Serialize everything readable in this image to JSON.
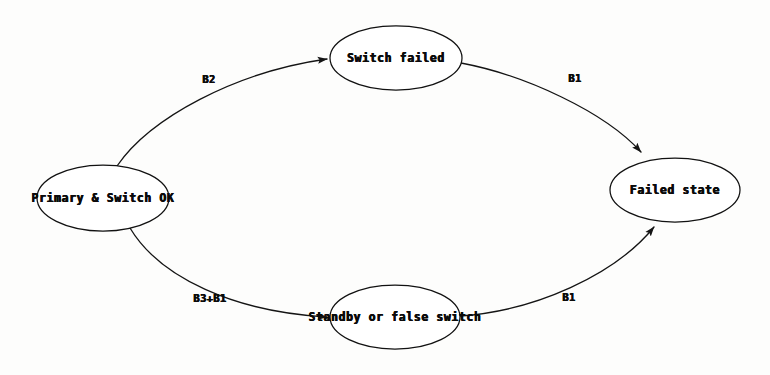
{
  "diagram": {
    "type": "state-transition-diagram",
    "background_color": "#fdfdfc",
    "stroke_color": "#141414",
    "text_color": "#0b0b0b",
    "nodes": [
      {
        "id": "primary-switch-ok",
        "label": "Primary & Switch OK",
        "cx": 103,
        "cy": 198,
        "rx": 66,
        "ry": 33
      },
      {
        "id": "switch-failed",
        "label": "Switch failed",
        "cx": 396,
        "cy": 58,
        "rx": 66,
        "ry": 32
      },
      {
        "id": "standby-or-false-switch",
        "label": "Standby or false switch",
        "cx": 395,
        "cy": 317,
        "rx": 65,
        "ry": 32
      },
      {
        "id": "failed-state",
        "label": "Failed state",
        "cx": 675,
        "cy": 190,
        "rx": 65,
        "ry": 32
      }
    ],
    "edges": [
      {
        "id": "edge-ok-to-switch-failed",
        "from": "primary-switch-ok",
        "to": "switch-failed",
        "label": "B2",
        "label_x": 209,
        "label_y": 79,
        "path": "M 117,166 C 150,118 235,72 327,59"
      },
      {
        "id": "edge-switch-failed-to-failed-state",
        "from": "switch-failed",
        "to": "failed-state",
        "label": "B1",
        "label_x": 575,
        "label_y": 78,
        "path": "M 461,63 C 525,75 605,112 641,152"
      },
      {
        "id": "edge-ok-to-standby",
        "from": "primary-switch-ok",
        "to": "standby-or-false-switch",
        "label": "B3+B1",
        "label_x": 210,
        "label_y": 298,
        "path": "M 130,228 C 160,278 235,312 327,317"
      },
      {
        "id": "edge-standby-to-failed-state",
        "from": "standby-or-false-switch",
        "to": "failed-state",
        "label": "B1",
        "label_x": 569,
        "label_y": 297,
        "path": "M 460,316 C 535,311 615,275 654,227"
      }
    ]
  }
}
